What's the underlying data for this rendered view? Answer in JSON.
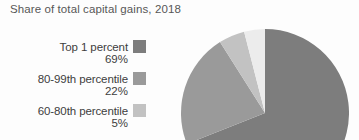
{
  "chart_title": "Share of total capital gains, 2018",
  "legend": {
    "items": [
      {
        "label": "Top 1 percent",
        "value": "69%",
        "color": "#7d7d7d"
      },
      {
        "label": "80-99th percentile",
        "value": "22%",
        "color": "#9a9a9a"
      },
      {
        "label": "60-80th percentile",
        "value": "5%",
        "color": "#c2c2c2"
      }
    ]
  },
  "chart_data": {
    "type": "pie",
    "title": "Share of total capital gains, 2018",
    "xlabel": "",
    "ylabel": "",
    "unit": "percent",
    "legend_position": "left",
    "grid": false,
    "labels": [
      "Top 1 percent",
      "80-99th percentile",
      "60-80th percentile",
      "Bottom 60th percentile"
    ],
    "values": [
      69,
      22,
      5,
      4
    ],
    "colors": [
      "#7d7d7d",
      "#9a9a9a",
      "#c2c2c2",
      "#ececec"
    ],
    "start_angle_deg": 0,
    "direction": "clockwise",
    "labeled_slices": [
      "Top 1 percent",
      "80-99th percentile",
      "60-80th percentile"
    ]
  }
}
